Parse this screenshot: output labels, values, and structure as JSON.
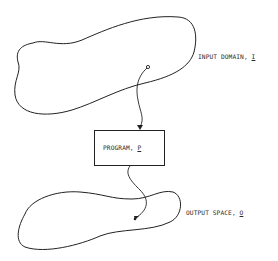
{
  "diagram": {
    "input_domain": {
      "label": "INPUT DOMAIN, ",
      "symbol": "I"
    },
    "program": {
      "label": "PROGRAM, ",
      "symbol": "P"
    },
    "output_space": {
      "label": "OUTPUT SPACE, ",
      "symbol": "O"
    },
    "edges": [
      {
        "from": "input_domain",
        "to": "program",
        "style": "arrow"
      },
      {
        "from": "program",
        "to": "output_space",
        "style": "arrow"
      }
    ],
    "colors": {
      "stroke": "#222222",
      "background": "#ffffff"
    }
  }
}
